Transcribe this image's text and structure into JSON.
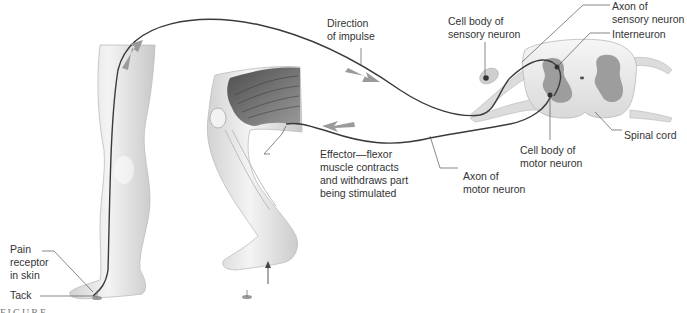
{
  "diagram": {
    "type": "reflex-arc-illustration",
    "labels": {
      "direction": [
        "Direction",
        "of impulse"
      ],
      "cell_body_sensory": [
        "Cell body of",
        "sensory neuron"
      ],
      "axon_sensory": [
        "Axon of",
        "sensory neuron"
      ],
      "interneuron": [
        "Interneuron"
      ],
      "spinal_cord": [
        "Spinal cord"
      ],
      "cell_body_motor": [
        "Cell body of",
        "motor neuron"
      ],
      "axon_motor": [
        "Axon of",
        "motor neuron"
      ],
      "effector": [
        "Effector—flexor",
        "muscle contracts",
        "and withdraws part",
        "being stimulated"
      ],
      "pain_receptor": [
        "Pain",
        "receptor",
        "in skin"
      ],
      "tack": [
        "Tack"
      ],
      "figure_fragment": "FIGURE"
    },
    "colors": {
      "nerve": "#3a3a3a",
      "leader": "#555555",
      "arrow": "#9a9a9a",
      "skin": "#e8e8e8",
      "skin_shadow": "#c4c4c4",
      "gray_matter": "#9d9d9d",
      "white_matter": "#ececec",
      "muscle": "#6e6e6e"
    }
  }
}
